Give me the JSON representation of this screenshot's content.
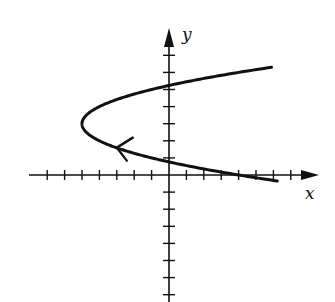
{
  "chart_data": {
    "type": "line",
    "title": "",
    "xlabel": "x",
    "ylabel": "y",
    "xlim": [
      -8,
      8
    ],
    "ylim": [
      -7,
      8
    ],
    "grid": false,
    "legend": null,
    "x_ticks": [
      -7,
      -6,
      -5,
      -4,
      -3,
      -2,
      -1,
      1,
      2,
      3,
      4,
      5,
      6,
      7
    ],
    "y_ticks": [
      -7,
      -6,
      -5,
      -4,
      -3,
      -2,
      -1,
      1,
      2,
      3,
      4,
      5,
      6,
      7
    ],
    "series": [
      {
        "name": "parametric curve",
        "equation": "x = y^2 - 6y + 4",
        "direction": "from lower-right end toward upper-right end (arrow on lower branch pointing left)",
        "points": [
          {
            "x": 5.9,
            "y": -0.3
          },
          {
            "x": 4.0,
            "y": 0.0
          },
          {
            "x": 0.0,
            "y": 0.76
          },
          {
            "x": -2.0,
            "y": 1.27
          },
          {
            "x": -4.0,
            "y": 2.0
          },
          {
            "x": -5.0,
            "y": 3.0
          },
          {
            "x": -4.0,
            "y": 4.0
          },
          {
            "x": -2.0,
            "y": 4.73
          },
          {
            "x": 0.0,
            "y": 5.24
          },
          {
            "x": 4.0,
            "y": 6.0
          },
          {
            "x": 5.9,
            "y": 6.3
          }
        ]
      }
    ],
    "annotations": [
      {
        "type": "arrow",
        "at": {
          "x": -3.0,
          "y": 1.6
        },
        "direction": "up-left"
      }
    ]
  },
  "labels": {
    "x_axis": "x",
    "y_axis": "y"
  },
  "colors": {
    "ink": "#111111",
    "background": "#ffffff"
  }
}
